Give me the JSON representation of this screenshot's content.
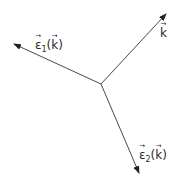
{
  "diagram": {
    "type": "vector-triad",
    "stroke_color": "#4a4a4a",
    "origin": {
      "x": 101,
      "y": 84
    },
    "vectors": [
      {
        "id": "epsilon1",
        "tip": {
          "x": 14,
          "y": 44
        }
      },
      {
        "id": "k",
        "tip": {
          "x": 166,
          "y": 14
        }
      },
      {
        "id": "epsilon2",
        "tip": {
          "x": 139,
          "y": 173
        }
      }
    ],
    "labels": {
      "epsilon1": {
        "symbol": "ε",
        "subscript": "1",
        "open": "(",
        "arg": "k",
        "close": ")",
        "arrow": "→"
      },
      "k": {
        "symbol": "k",
        "arrow": "→"
      },
      "epsilon2": {
        "symbol": "ε",
        "subscript": "2",
        "open": "(",
        "arg": "k",
        "close": ")",
        "arrow": "→"
      }
    }
  }
}
